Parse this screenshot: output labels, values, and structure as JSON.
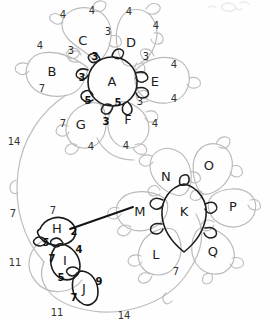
{
  "diagram": {
    "style": "pencil-sketch",
    "colors": {
      "background": "#fefefe",
      "light_stroke": "#b9b9b9",
      "dark_stroke": "#1a1a1a",
      "text": "#1c1c1c"
    },
    "clusters": [
      {
        "name": "upper-cluster",
        "center": "A",
        "petals": [
          "B",
          "C",
          "D",
          "E",
          "F",
          "G"
        ]
      },
      {
        "name": "lower-right-cluster",
        "center": "K",
        "petals": [
          "L",
          "M",
          "N",
          "O",
          "P",
          "Q"
        ]
      },
      {
        "name": "lower-left-cluster",
        "center": "H",
        "petals": [
          "I",
          "J"
        ]
      }
    ],
    "nodes": [
      {
        "id": "A",
        "label": "A",
        "x": 112,
        "y": 82,
        "emphasis": "dark"
      },
      {
        "id": "B",
        "label": "B",
        "x": 52,
        "y": 72,
        "emphasis": "light"
      },
      {
        "id": "C",
        "label": "C",
        "x": 83,
        "y": 41,
        "emphasis": "light"
      },
      {
        "id": "D",
        "label": "D",
        "x": 131,
        "y": 43,
        "emphasis": "light"
      },
      {
        "id": "E",
        "label": "E",
        "x": 155,
        "y": 82,
        "emphasis": "light"
      },
      {
        "id": "F",
        "label": "F",
        "x": 128,
        "y": 120,
        "emphasis": "light"
      },
      {
        "id": "G",
        "label": "G",
        "x": 81,
        "y": 125,
        "emphasis": "light"
      },
      {
        "id": "H",
        "label": "H",
        "x": 57,
        "y": 229,
        "emphasis": "dark"
      },
      {
        "id": "I",
        "label": "I",
        "x": 65,
        "y": 261,
        "emphasis": "dark"
      },
      {
        "id": "J",
        "label": "J",
        "x": 84,
        "y": 289,
        "emphasis": "dark"
      },
      {
        "id": "K",
        "label": "K",
        "x": 184,
        "y": 212,
        "emphasis": "dark"
      },
      {
        "id": "L",
        "label": "L",
        "x": 156,
        "y": 255,
        "emphasis": "light"
      },
      {
        "id": "M",
        "label": "M",
        "x": 140,
        "y": 212,
        "emphasis": "light"
      },
      {
        "id": "N",
        "label": "N",
        "x": 166,
        "y": 177,
        "emphasis": "light"
      },
      {
        "id": "O",
        "label": "O",
        "x": 209,
        "y": 166,
        "emphasis": "light"
      },
      {
        "id": "P",
        "label": "P",
        "x": 233,
        "y": 207,
        "emphasis": "light"
      },
      {
        "id": "Q",
        "label": "Q",
        "x": 213,
        "y": 252,
        "emphasis": "light"
      }
    ],
    "weights": [
      {
        "value": "4",
        "x": 63,
        "y": 15,
        "style": "outer"
      },
      {
        "value": "4",
        "x": 92,
        "y": 11,
        "style": "outer"
      },
      {
        "value": "4",
        "x": 129,
        "y": 12,
        "style": "outer"
      },
      {
        "value": "4",
        "x": 156,
        "y": 26,
        "style": "outer"
      },
      {
        "value": "4",
        "x": 40,
        "y": 46,
        "style": "outer"
      },
      {
        "value": "3",
        "x": 71,
        "y": 51,
        "style": "mid"
      },
      {
        "value": "3",
        "x": 108,
        "y": 32,
        "style": "mid"
      },
      {
        "value": "3",
        "x": 95,
        "y": 57,
        "style": "dark"
      },
      {
        "value": "3",
        "x": 146,
        "y": 57,
        "style": "mid"
      },
      {
        "value": "3",
        "x": 82,
        "y": 78,
        "style": "dark"
      },
      {
        "value": "4",
        "x": 174,
        "y": 65,
        "style": "outer"
      },
      {
        "value": "4",
        "x": 174,
        "y": 99,
        "style": "outer"
      },
      {
        "value": "3",
        "x": 140,
        "y": 102,
        "style": "mid"
      },
      {
        "value": "5",
        "x": 88,
        "y": 101,
        "style": "dark"
      },
      {
        "value": "5",
        "x": 118,
        "y": 103,
        "style": "dark"
      },
      {
        "value": "7",
        "x": 42,
        "y": 89,
        "style": "outer"
      },
      {
        "value": "7",
        "x": 63,
        "y": 124,
        "style": "outer"
      },
      {
        "value": "3",
        "x": 106,
        "y": 122,
        "style": "dark"
      },
      {
        "value": "4",
        "x": 91,
        "y": 147,
        "style": "outer"
      },
      {
        "value": "4",
        "x": 126,
        "y": 146,
        "style": "outer"
      },
      {
        "value": "4",
        "x": 155,
        "y": 124,
        "style": "outer"
      },
      {
        "value": "14",
        "x": 14,
        "y": 142,
        "style": "outer"
      },
      {
        "value": "7",
        "x": 13,
        "y": 214,
        "style": "outer"
      },
      {
        "value": "11",
        "x": 15,
        "y": 263,
        "style": "outer"
      },
      {
        "value": "7",
        "x": 53,
        "y": 211,
        "style": "outer"
      },
      {
        "value": "2",
        "x": 74,
        "y": 232,
        "style": "dark"
      },
      {
        "value": "5",
        "x": 46,
        "y": 243,
        "style": "dark"
      },
      {
        "value": "4",
        "x": 79,
        "y": 250,
        "style": "dark"
      },
      {
        "value": "7",
        "x": 52,
        "y": 259,
        "style": "dark"
      },
      {
        "value": "5",
        "x": 61,
        "y": 278,
        "style": "dark"
      },
      {
        "value": "9",
        "x": 99,
        "y": 282,
        "style": "dark"
      },
      {
        "value": "7",
        "x": 74,
        "y": 298,
        "style": "dark"
      },
      {
        "value": "11",
        "x": 57,
        "y": 313,
        "style": "outer"
      },
      {
        "value": "14",
        "x": 124,
        "y": 316,
        "style": "outer"
      },
      {
        "value": "7",
        "x": 176,
        "y": 272,
        "style": "outer"
      }
    ],
    "edges": [
      {
        "from": "H",
        "to": "M",
        "style": "dark",
        "weight": "2"
      }
    ]
  }
}
